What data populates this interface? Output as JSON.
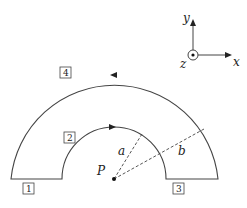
{
  "diagram": {
    "labels": {
      "point": "P",
      "inner_radius": "a",
      "outer_radius": "b",
      "segment_1": "1",
      "segment_2": "2",
      "segment_3": "3",
      "segment_4": "4"
    },
    "axes": {
      "x": "x",
      "y": "y",
      "z": "z"
    }
  }
}
